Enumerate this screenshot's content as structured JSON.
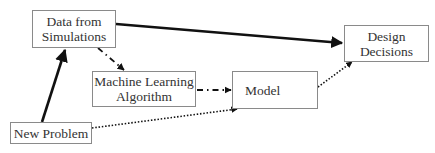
{
  "diagram": {
    "type": "flowchart",
    "nodes": [
      {
        "id": "data",
        "lines": [
          "Data from",
          "Simulations"
        ]
      },
      {
        "id": "design",
        "lines": [
          "Design",
          "Decisions"
        ]
      },
      {
        "id": "ml",
        "lines": [
          "Machine Learning",
          "Algorithm"
        ]
      },
      {
        "id": "model",
        "lines": [
          "Model"
        ]
      },
      {
        "id": "new",
        "lines": [
          "New Problem"
        ]
      }
    ],
    "edges": [
      {
        "from": "new",
        "to": "data",
        "style": "solid-thick"
      },
      {
        "from": "data",
        "to": "design",
        "style": "solid-thick"
      },
      {
        "from": "data",
        "to": "ml",
        "style": "dash-dot"
      },
      {
        "from": "ml",
        "to": "model",
        "style": "dash-dot"
      },
      {
        "from": "new",
        "to": "model",
        "style": "dotted"
      },
      {
        "from": "model",
        "to": "design",
        "style": "dotted"
      }
    ],
    "colors": {
      "line": "#111111",
      "box_border": "#8a8a8a",
      "text": "#333333"
    }
  }
}
